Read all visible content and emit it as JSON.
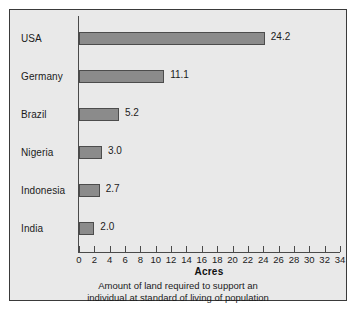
{
  "chart_data": {
    "type": "bar",
    "orientation": "horizontal",
    "title": "",
    "xlabel": "Acres",
    "ylabel": "",
    "categories": [
      "USA",
      "Germany",
      "Brazil",
      "Nigeria",
      "Indonesia",
      "India"
    ],
    "values": [
      24.2,
      11.1,
      5.2,
      3.0,
      2.7,
      2.0
    ],
    "value_labels": [
      "24.2",
      "11.1",
      "5.2",
      "3.0",
      "2.7",
      "2.0"
    ],
    "xlim": [
      0,
      34
    ],
    "xticks": [
      0,
      2,
      4,
      6,
      8,
      10,
      12,
      14,
      16,
      18,
      20,
      22,
      24,
      26,
      28,
      30,
      32,
      34
    ],
    "xtick_labels": [
      "0",
      "2",
      "4",
      "6",
      "8",
      "10",
      "12",
      "14",
      "16",
      "18",
      "20",
      "22",
      "24",
      "26",
      "28",
      "30",
      "32",
      "34"
    ],
    "grid": false,
    "legend": null,
    "caption_lines": [
      "Amount of land required to support an",
      "individual at standard of living of population"
    ],
    "colors": {
      "bar_fill": "#8b8b8b",
      "bar_border": "#4c4c4c",
      "plot_background": "#e9e9e9",
      "frame_border": "#3a3a3a",
      "axis": "#4a4a4a",
      "text": "#1b1b1b"
    }
  }
}
